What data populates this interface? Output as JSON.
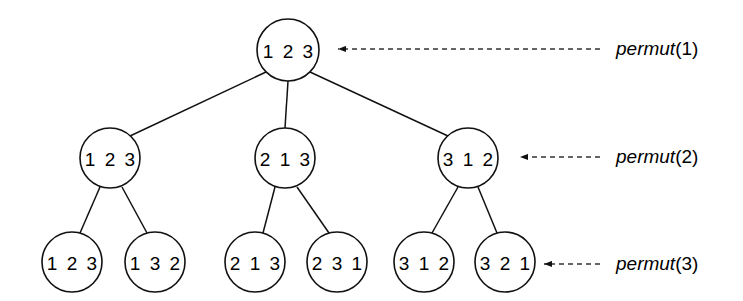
{
  "diagram": {
    "stroke_color": "#111111",
    "background_color": "#ffffff",
    "levels": [
      {
        "level": 1,
        "callout_label_name": "permut",
        "callout_label_arg": "(1)",
        "nodes": [
          {
            "id": "root",
            "text": "1 2 3",
            "cx": 288,
            "cy": 50,
            "rx": 31,
            "ry": 31
          }
        ]
      },
      {
        "level": 2,
        "callout_label_name": "permut",
        "callout_label_arg": "(2)",
        "nodes": [
          {
            "id": "n2a",
            "text": "1 2 3",
            "cx": 110,
            "cy": 158,
            "rx": 30,
            "ry": 30
          },
          {
            "id": "n2b",
            "text": "2 1 3",
            "cx": 285,
            "cy": 158,
            "rx": 30,
            "ry": 30
          },
          {
            "id": "n2c",
            "text": "3 1 2",
            "cx": 468,
            "cy": 158,
            "rx": 30,
            "ry": 30
          }
        ]
      },
      {
        "level": 3,
        "callout_label_name": "permut",
        "callout_label_arg": "(3)",
        "nodes": [
          {
            "id": "n3a",
            "text": "1 2 3",
            "cx": 72,
            "cy": 262,
            "rx": 30,
            "ry": 30
          },
          {
            "id": "n3b",
            "text": "1 3 2",
            "cx": 155,
            "cy": 262,
            "rx": 30,
            "ry": 30
          },
          {
            "id": "n3c",
            "text": "2 1 3",
            "cx": 255,
            "cy": 262,
            "rx": 30,
            "ry": 30
          },
          {
            "id": "n3d",
            "text": "2 3 1",
            "cx": 337,
            "cy": 262,
            "rx": 30,
            "ry": 30
          },
          {
            "id": "n3e",
            "text": "3 1 2",
            "cx": 424,
            "cy": 262,
            "rx": 30,
            "ry": 30
          },
          {
            "id": "n3f",
            "text": "3 2 1",
            "cx": 505,
            "cy": 262,
            "rx": 30,
            "ry": 30
          }
        ]
      }
    ],
    "edges": [
      {
        "from": "root",
        "to": "n2a",
        "x1": 266,
        "y1": 72,
        "x2": 130,
        "y2": 136
      },
      {
        "from": "root",
        "to": "n2b",
        "x1": 288,
        "y1": 81,
        "x2": 285,
        "y2": 128
      },
      {
        "from": "root",
        "to": "n2c",
        "x1": 310,
        "y1": 72,
        "x2": 448,
        "y2": 136
      },
      {
        "from": "n2a",
        "to": "n3a",
        "x1": 100,
        "y1": 187,
        "x2": 80,
        "y2": 233
      },
      {
        "from": "n2a",
        "to": "n3b",
        "x1": 122,
        "y1": 187,
        "x2": 147,
        "y2": 233
      },
      {
        "from": "n2b",
        "to": "n3c",
        "x1": 275,
        "y1": 187,
        "x2": 263,
        "y2": 233
      },
      {
        "from": "n2b",
        "to": "n3d",
        "x1": 297,
        "y1": 187,
        "x2": 329,
        "y2": 233
      },
      {
        "from": "n2c",
        "to": "n3e",
        "x1": 458,
        "y1": 187,
        "x2": 432,
        "y2": 233
      },
      {
        "from": "n2c",
        "to": "n3f",
        "x1": 478,
        "y1": 187,
        "x2": 497,
        "y2": 233
      }
    ],
    "callouts": [
      {
        "id": "c1",
        "target": "root",
        "tail_x": 600,
        "tip_x": 338,
        "y": 49,
        "label_x": 616,
        "label_name": "permut",
        "label_arg": "(1)"
      },
      {
        "id": "c2",
        "target": "n2c",
        "tail_x": 600,
        "tip_x": 520,
        "y": 157,
        "label_x": 616,
        "label_name": "permut",
        "label_arg": "(2)"
      },
      {
        "id": "c3",
        "target": "n3f",
        "tail_x": 600,
        "tip_x": 544,
        "y": 264,
        "label_x": 616,
        "label_name": "permut",
        "label_arg": "(3)"
      }
    ]
  }
}
